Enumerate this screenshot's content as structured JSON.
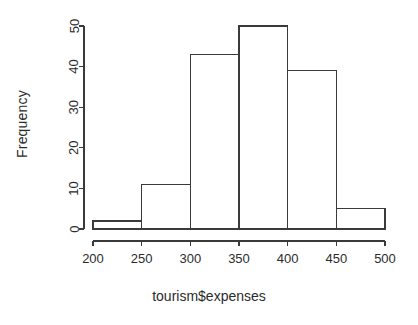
{
  "chart_data": {
    "type": "bar",
    "title": "",
    "subtitle": "",
    "xlabel": "tourism$expenses",
    "ylabel": "Frequency",
    "categories": [
      "200-250",
      "250-300",
      "300-350",
      "350-400",
      "400-450",
      "450-500"
    ],
    "bin_edges": [
      200,
      250,
      300,
      350,
      400,
      450,
      500
    ],
    "values": [
      2,
      11,
      43,
      50,
      39,
      5
    ],
    "xlim": [
      200,
      500
    ],
    "ylim": [
      0,
      50
    ],
    "xticks": [
      200,
      250,
      300,
      350,
      400,
      450,
      500
    ],
    "yticks": [
      0,
      10,
      20,
      30,
      40,
      50
    ],
    "xtick_labels": [
      "200",
      "250",
      "300",
      "350",
      "400",
      "450",
      "500"
    ],
    "ytick_labels": [
      "0",
      "10",
      "20",
      "30",
      "40",
      "50"
    ],
    "grid": false,
    "legend": false,
    "legend_position": "none",
    "bar_fill": "none",
    "bar_stroke": "#3a3a3a",
    "background": "#ffffff",
    "text_color": "#2b2b2b",
    "annotations": []
  }
}
